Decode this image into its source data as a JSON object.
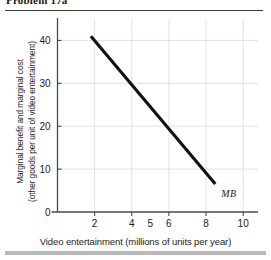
{
  "figure": {
    "problem_caption": "Problem 17a"
  },
  "chart_data": {
    "type": "line",
    "title": "",
    "xlabel": "Video entertainment (millions of units per year)",
    "ylabel": "Marginal benefit and marginal cost",
    "ylabel_line2": "(other goods per unit of video entertainment)",
    "xlim": [
      0,
      10.8
    ],
    "ylim": [
      0,
      45
    ],
    "xticks": [
      2,
      4,
      6,
      8,
      10
    ],
    "xtick_labels": [
      "2",
      "4",
      "6",
      "8",
      "10"
    ],
    "extra_xlabels": [
      {
        "value": 5,
        "label": "5"
      }
    ],
    "yticks": [
      10,
      20,
      30,
      40
    ],
    "ytick_labels": [
      "10",
      "20",
      "30",
      "40"
    ],
    "origin_label": "0",
    "grid": true,
    "legend_position": "inline-end-of-line",
    "series": [
      {
        "name": "MB",
        "label": "MB",
        "color": "#111111",
        "x": [
          1.8,
          8.5
        ],
        "values": [
          41,
          6.5
        ],
        "points": [
          {
            "x": 1.8,
            "y": 41
          },
          {
            "x": 8.5,
            "y": 6.5
          }
        ]
      }
    ]
  }
}
